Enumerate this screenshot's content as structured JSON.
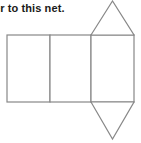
{
  "page": {
    "background_color": "#ffffff",
    "width": 141,
    "height": 143
  },
  "question": {
    "text": "er to this net.",
    "full_text_visible": "er to this net.",
    "color": "#1a1a1a",
    "truncated_left": true
  },
  "figure": {
    "name": "net-of-triangular-prism",
    "stroke_color": "#888888",
    "fill_color": "#ffffff",
    "stroke_width": 1.2,
    "shapes": {
      "rectangles": [
        {
          "name": "rectangle-left",
          "x": 7,
          "y": 35,
          "width": 43,
          "height": 67
        },
        {
          "name": "rectangle-middle",
          "x": 50,
          "y": 35,
          "width": 41,
          "height": 67
        },
        {
          "name": "rectangle-right",
          "x": 91,
          "y": 35,
          "width": 43,
          "height": 67
        }
      ],
      "triangles": [
        {
          "name": "triangle-top",
          "points": "91,35 112.5,1 134,35"
        },
        {
          "name": "triangle-bottom",
          "points": "91,102 112.5,139 134,102"
        }
      ]
    }
  }
}
